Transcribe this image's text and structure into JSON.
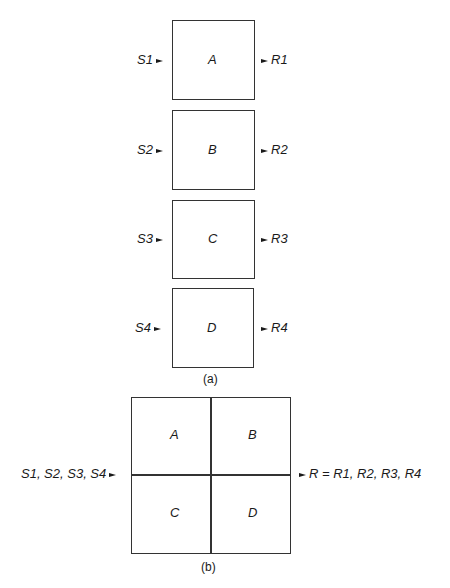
{
  "diagram_a": {
    "caption": "(a)",
    "modules": [
      {
        "name": "A",
        "input": "S1",
        "output": "R1"
      },
      {
        "name": "B",
        "input": "S2",
        "output": "R2"
      },
      {
        "name": "C",
        "input": "S3",
        "output": "R3"
      },
      {
        "name": "D",
        "input": "S4",
        "output": "R4"
      }
    ]
  },
  "diagram_b": {
    "caption": "(b)",
    "cells": [
      "A",
      "B",
      "C",
      "D"
    ],
    "input": "S1, S2, S3, S4",
    "output": "R = R1, R2, R3, R4"
  }
}
